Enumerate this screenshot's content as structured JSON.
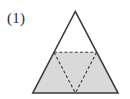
{
  "figure": {
    "label": "(1)",
    "caption_number": "1",
    "background_color": "#ffffff",
    "outline_color": "#3a3a3a",
    "dashed_color": "#3a3a3a",
    "shade_color": "#d9d9d9",
    "label_color": "#2b2b2b",
    "outline_width": "1.6",
    "dashed_width": "1.1",
    "dash_pattern": "3,2.2",
    "geometry": {
      "apex": {
        "x": 75.3,
        "y": 11.5
      },
      "bottom_left": {
        "x": 32.8,
        "y": 93.0
      },
      "bottom_right": {
        "x": 118.0,
        "y": 93.0
      },
      "left_midpoint": {
        "x": 54.0,
        "y": 52.3
      },
      "right_midpoint": {
        "x": 96.7,
        "y": 52.3
      },
      "base_midpoint": {
        "x": 75.4,
        "y": 93.0
      }
    },
    "shaded_region": "32.8,93.0 54.0,52.3 96.7,52.3 118.0,93.0",
    "outline_path": "75.3,11.5 32.8,93.0 118.0,93.0",
    "midsegment": {
      "x1": 54.0,
      "y1": 52.3,
      "x2": 96.7,
      "y2": 52.3
    },
    "medial_left_edge": {
      "x1": 54.0,
      "y1": 52.3,
      "x2": 75.4,
      "y2": 93.0
    },
    "medial_right_edge": {
      "x1": 96.7,
      "y1": 52.3,
      "x2": 75.4,
      "y2": 93.0
    }
  }
}
